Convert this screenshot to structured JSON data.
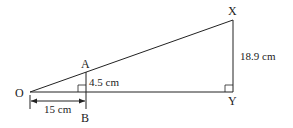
{
  "diagram": {
    "points": {
      "O": "O",
      "A": "A",
      "B": "B",
      "X": "X",
      "Y": "Y"
    },
    "measurements": {
      "OB": "15 cm",
      "AB": "4.5 cm",
      "XY": "18.9 cm"
    },
    "colors": {
      "line": "#222222",
      "background": "#ffffff"
    }
  }
}
